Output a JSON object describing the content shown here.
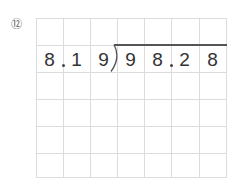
{
  "problem": {
    "number_label": "⑫",
    "type": "long-division",
    "divisor": "8.19",
    "dividend": "98.28",
    "divisor_cells": [
      "8",
      "1",
      "9"
    ],
    "dividend_cells": [
      "9",
      "8",
      "2",
      "8"
    ]
  },
  "grid": {
    "columns": 7,
    "rows": 6,
    "line_color": "#dcdcdc"
  }
}
